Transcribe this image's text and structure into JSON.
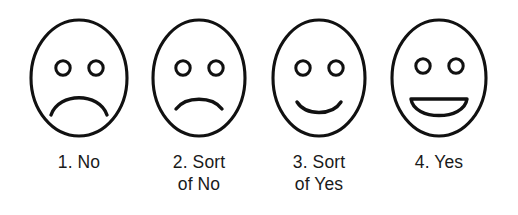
{
  "scale": {
    "name": "faces-rating-scale",
    "points": 4,
    "stroke_color": "#111111",
    "fill_color": "#ffffff",
    "background_color": "#ffffff",
    "text_color": "#1a1a1a",
    "items": [
      {
        "number": "1.",
        "label": "1. No",
        "caption_lines": "1. No",
        "answer": "No",
        "face_icon": "frowning-face-icon",
        "expression": "sad",
        "mouth": "deep-frown"
      },
      {
        "number": "2.",
        "label": "2. Sort of No",
        "caption_lines": "2. Sort\nof No",
        "answer": "Sort of No",
        "face_icon": "slightly-frowning-face-icon",
        "expression": "slightly-sad",
        "mouth": "shallow-frown"
      },
      {
        "number": "3.",
        "label": "3. Sort of Yes",
        "caption_lines": "3. Sort\nof Yes",
        "answer": "Sort of Yes",
        "face_icon": "slightly-smiling-face-icon",
        "expression": "slightly-happy",
        "mouth": "shallow-smile"
      },
      {
        "number": "4.",
        "label": "4. Yes",
        "caption_lines": "4. Yes",
        "answer": "Yes",
        "face_icon": "grinning-face-icon",
        "expression": "happy",
        "mouth": "open-smile"
      }
    ]
  }
}
